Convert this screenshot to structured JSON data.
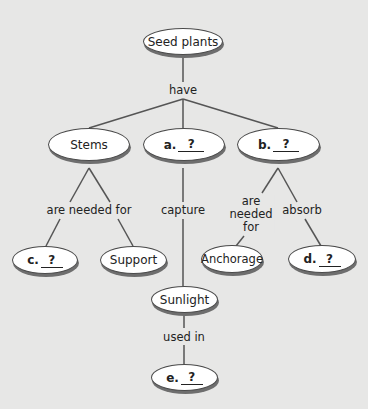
{
  "colors": {
    "background": "#e7e7e6",
    "node_fill": "#ffffff",
    "node_border": "#4a4a4a",
    "line": "#555555"
  },
  "nodes": {
    "root": {
      "text": "Seed plants"
    },
    "stems": {
      "text": "Stems"
    },
    "a": {
      "letter": "a.",
      "blank": "?"
    },
    "b": {
      "letter": "b.",
      "blank": "?"
    },
    "c": {
      "letter": "c.",
      "blank": "?"
    },
    "support": {
      "text": "Support"
    },
    "anchorage": {
      "text": "Anchorage"
    },
    "d": {
      "letter": "d.",
      "blank": "?"
    },
    "sunlight": {
      "text": "Sunlight"
    },
    "e": {
      "letter": "e.",
      "blank": "?"
    }
  },
  "links": {
    "have": "have",
    "stems_needed": "are needed for",
    "capture": "capture",
    "b_needed_1": "are",
    "b_needed_2": "needed",
    "b_needed_3": "for",
    "absorb": "absorb",
    "used_in": "used in"
  }
}
